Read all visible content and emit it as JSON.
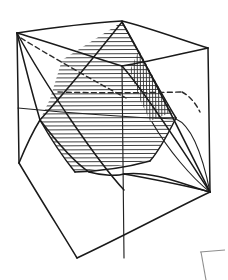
{
  "figure": {
    "title": "Cube with inscribed octahedron hexagonal cross-section",
    "caption": "",
    "background_color": "#ffffff",
    "ink_color": "#1a1a1a",
    "hatch_color": "#2a2a2a",
    "crop_mark_color": "#8e8e8e",
    "style": "hand-drawn pen line sketch",
    "canvas": {
      "width": 228,
      "height": 280
    }
  },
  "geometry": {
    "cube_vertices": {
      "front_top_left": [
        17,
        33
      ],
      "back_top_peak": [
        122,
        22
      ],
      "back_top_right": [
        208,
        48
      ],
      "front_top_mid": [
        122,
        66
      ],
      "front_bottom_left": [
        19,
        163
      ],
      "front_bottom_mid": [
        77,
        258
      ],
      "front_bottom_right": [
        210,
        192
      ],
      "back_inner": [
        122,
        66
      ]
    },
    "cube_edges": [
      {
        "name": "top-left-to-peak",
        "from": [
          17,
          33
        ],
        "to": [
          122,
          22
        ],
        "style": "solid"
      },
      {
        "name": "peak-to-top-right",
        "from": [
          122,
          22
        ],
        "to": [
          208,
          48
        ],
        "style": "solid"
      },
      {
        "name": "top-left-to-front-mid",
        "from": [
          17,
          33
        ],
        "to": [
          122,
          66
        ],
        "style": "solid"
      },
      {
        "name": "front-mid-to-top-right",
        "from": [
          122,
          66
        ],
        "to": [
          208,
          48
        ],
        "style": "solid"
      },
      {
        "name": "left-vertical",
        "from": [
          17,
          33
        ],
        "to": [
          19,
          163
        ],
        "style": "solid"
      },
      {
        "name": "right-vertical",
        "from": [
          208,
          48
        ],
        "to": [
          210,
          192
        ],
        "style": "solid"
      },
      {
        "name": "center-vertical",
        "from": [
          122,
          66
        ],
        "to": [
          124,
          258
        ],
        "style": "solid"
      },
      {
        "name": "bottom-left-edge",
        "from": [
          19,
          163
        ],
        "to": [
          77,
          258
        ],
        "style": "solid"
      },
      {
        "name": "bottom-right-edge",
        "from": [
          77,
          258
        ],
        "to": [
          210,
          192
        ],
        "style": "solid"
      }
    ],
    "octahedron": {
      "apex_top": [
        122,
        22
      ],
      "apex_bottom": [
        124,
        188
      ],
      "left": [
        40,
        120
      ],
      "right": [
        210,
        192
      ],
      "mid_front": [
        122,
        66
      ],
      "mid_back": [
        17,
        33
      ]
    },
    "hatched_cross_section": {
      "name": "hexagonal-section",
      "hatch_direction": "horizontal",
      "hatch_spacing_px": 4,
      "polygon": [
        [
          122,
          22
        ],
        [
          175,
          118
        ],
        [
          152,
          160
        ],
        [
          75,
          172
        ],
        [
          40,
          120
        ],
        [
          62,
          60
        ]
      ]
    },
    "hatched_side_face": {
      "name": "right-triangular-face",
      "hatch_direction": "vertical",
      "hatch_spacing_px": 3,
      "polygon": [
        [
          140,
          52
        ],
        [
          172,
          112
        ],
        [
          152,
          120
        ],
        [
          132,
          68
        ]
      ]
    },
    "hidden_edges": [
      {
        "name": "hidden-edge-topleft-to-center",
        "from": [
          20,
          37
        ],
        "to": [
          124,
          96
        ],
        "style": "dashed"
      },
      {
        "name": "hidden-edge-center-to-right",
        "from": [
          60,
          92
        ],
        "to": [
          180,
          92
        ],
        "style": "dashed"
      }
    ],
    "crop_mark": {
      "name": "corner-crop-mark",
      "points": [
        [
          200,
          252
        ],
        [
          224,
          250
        ],
        [
          226,
          280
        ]
      ]
    }
  }
}
